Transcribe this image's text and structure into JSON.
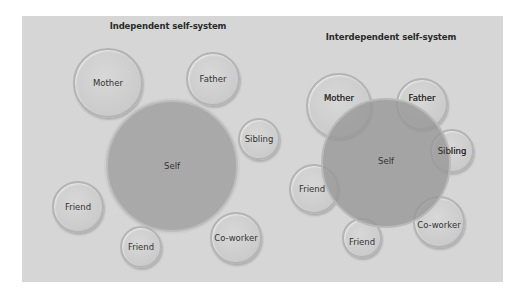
{
  "diagrams": [
    {
      "title": "Independent self-system",
      "self": {
        "label": "Self"
      },
      "others": [
        {
          "label": "Mother"
        },
        {
          "label": "Father"
        },
        {
          "label": "Sibling"
        },
        {
          "label": "Friend"
        },
        {
          "label": "Friend"
        },
        {
          "label": "Co-worker"
        }
      ]
    },
    {
      "title": "Interdependent self-system",
      "self": {
        "label": "Self"
      },
      "others": [
        {
          "label": "Mother"
        },
        {
          "label": "Father"
        },
        {
          "label": "Sibling"
        },
        {
          "label": "Friend"
        },
        {
          "label": "Friend"
        },
        {
          "label": "Co-worker"
        }
      ]
    }
  ],
  "colors": {
    "panel": "#d6d6d6",
    "self_fill": "#a9a9a9",
    "other_fill": "#cbcbcb",
    "overlap_fill": "#9a9a9a"
  }
}
